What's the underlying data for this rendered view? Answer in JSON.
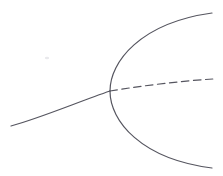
{
  "figure": {
    "kind": "pitchfork-bifurcation-diagram",
    "width": 223,
    "height": 176,
    "background_color": "#ffffff",
    "stroke_color": "#55555f",
    "stroke_width": 1.2,
    "title": "",
    "axis_visible": false,
    "gridlines": false,
    "legend": false,
    "labels": [],
    "tick_labels": []
  },
  "chart_data": {
    "type": "line",
    "title": "",
    "xlabel": "",
    "ylabel": "",
    "xlim": [
      0,
      223
    ],
    "ylim": [
      0,
      176
    ],
    "grid": false,
    "legend_position": "none",
    "y_axis_inverted": true,
    "bifurcation_point": {
      "x": 110,
      "y": 91
    },
    "series": [
      {
        "name": "lower-branch-solid",
        "style": "solid",
        "color": "#55555f",
        "stability": "stable",
        "path": "M 11 126 C 40 118, 78 102, 110 91",
        "points": [
          {
            "x": 11,
            "y": 126
          },
          {
            "x": 45,
            "y": 114
          },
          {
            "x": 85,
            "y": 101
          },
          {
            "x": 110,
            "y": 91
          }
        ]
      },
      {
        "name": "upper-branch-solid",
        "style": "solid",
        "color": "#55555f",
        "stability": "stable",
        "path": "M 110 91 C 110 62, 140 23, 212 13",
        "points": [
          {
            "x": 110,
            "y": 91
          },
          {
            "x": 117,
            "y": 50
          },
          {
            "x": 135,
            "y": 32
          },
          {
            "x": 212,
            "y": 13
          }
        ]
      },
      {
        "name": "lower-arc-solid",
        "style": "solid",
        "color": "#55555f",
        "stability": "stable",
        "path": "M 110 91 C 110 121, 141 159, 212 168",
        "points": [
          {
            "x": 110,
            "y": 91
          },
          {
            "x": 118,
            "y": 115
          },
          {
            "x": 140,
            "y": 138
          },
          {
            "x": 212,
            "y": 168
          }
        ]
      },
      {
        "name": "middle-branch-dashed",
        "style": "dashed",
        "color": "#55555f",
        "stability": "unstable",
        "dash_length": 7.5,
        "gap_length": 4.5,
        "path": "M 110 91 C 140 86, 180 81, 213 79",
        "points": [
          {
            "x": 110,
            "y": 91
          },
          {
            "x": 150,
            "y": 84
          },
          {
            "x": 185,
            "y": 80
          },
          {
            "x": 213,
            "y": 79
          }
        ]
      }
    ],
    "artifacts": [
      {
        "name": "scan-speck",
        "x": 47,
        "y": 58,
        "rx": 2.2,
        "ry": 1.3
      }
    ]
  }
}
